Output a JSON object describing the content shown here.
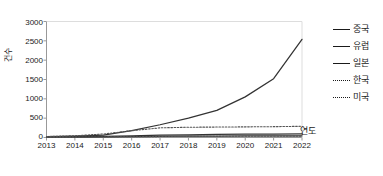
{
  "chart_data": {
    "type": "line",
    "title": "",
    "xlabel": "연도",
    "ylabel": "건수",
    "categories": [
      "2013",
      "2014",
      "2015",
      "2016",
      "2017",
      "2018",
      "2019",
      "2020",
      "2021",
      "2022"
    ],
    "x": [
      2013,
      2014,
      2015,
      2016,
      2017,
      2018,
      2019,
      2020,
      2021,
      2022
    ],
    "xlim": [
      2013,
      2022
    ],
    "ylim": [
      0,
      3000
    ],
    "yticks": [
      0,
      500,
      1000,
      1500,
      2000,
      2500,
      3000
    ],
    "grid": false,
    "legend_position": "right",
    "series": [
      {
        "name": "중국",
        "style": "solid",
        "color": "#333333",
        "values": [
          20,
          35,
          60,
          180,
          330,
          500,
          700,
          1050,
          1520,
          2540
        ]
      },
      {
        "name": "유럽",
        "style": "solid",
        "color": "#333333",
        "values": [
          15,
          20,
          30,
          45,
          60,
          70,
          80,
          85,
          90,
          95
        ]
      },
      {
        "name": "일본",
        "style": "solid",
        "color": "#333333",
        "values": [
          10,
          12,
          18,
          25,
          30,
          35,
          38,
          40,
          42,
          45
        ]
      },
      {
        "name": "한국",
        "style": "dotted",
        "color": "#555555",
        "values": [
          25,
          45,
          90,
          175,
          250,
          265,
          270,
          275,
          280,
          290
        ]
      },
      {
        "name": "미국",
        "style": "dotted",
        "color": "#555555",
        "values": [
          8,
          10,
          14,
          20,
          24,
          28,
          30,
          32,
          34,
          36
        ]
      }
    ]
  },
  "colors": {
    "axis": "#999999",
    "text": "#1a1a1a",
    "line_solid": "#333333",
    "line_dotted": "#555555"
  }
}
